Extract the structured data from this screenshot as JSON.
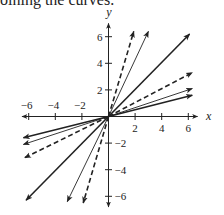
{
  "caption": "oining the curves.",
  "chart_data": {
    "type": "line",
    "title": "",
    "xlabel": "x",
    "ylabel": "y",
    "xlim": [
      -6.5,
      6.7
    ],
    "ylim": [
      -6.8,
      7.0
    ],
    "xticks": [
      -6,
      -4,
      -2,
      2,
      4,
      6
    ],
    "yticks": [
      6,
      4,
      2,
      -2,
      -4,
      -6
    ],
    "xtick_labels": [
      "-6",
      "-4",
      "-2",
      "2",
      "4",
      "6"
    ],
    "ytick_labels": [
      "6",
      "4",
      "2",
      "-2",
      "-4",
      "-6"
    ],
    "grid": false,
    "legend": null,
    "series": [
      {
        "name": "steep-dashed-up",
        "style": "dashed",
        "weight": "bold",
        "from": [
          0,
          0
        ],
        "to": [
          1.9,
          6.4
        ]
      },
      {
        "name": "steep-thin-up",
        "style": "solid",
        "weight": "thin",
        "from": [
          0,
          0
        ],
        "to": [
          3.0,
          6.4
        ]
      },
      {
        "name": "diag-bold-up",
        "style": "solid",
        "weight": "bold",
        "from": [
          0,
          0
        ],
        "to": [
          6.1,
          6.2
        ]
      },
      {
        "name": "shallow-dashed-up",
        "style": "dashed",
        "weight": "bold",
        "from": [
          0,
          0
        ],
        "to": [
          6.3,
          3.3
        ]
      },
      {
        "name": "shallow-thin-up",
        "style": "solid",
        "weight": "thin",
        "from": [
          0,
          0
        ],
        "to": [
          6.3,
          2.1
        ]
      },
      {
        "name": "shallow-bold-up",
        "style": "solid",
        "weight": "bold",
        "from": [
          0,
          0
        ],
        "to": [
          6.3,
          1.6
        ]
      },
      {
        "name": "shallow-bold-down",
        "style": "solid",
        "weight": "bold",
        "from": [
          0,
          0
        ],
        "to": [
          -6.4,
          -1.6
        ]
      },
      {
        "name": "shallow-thin-down",
        "style": "solid",
        "weight": "thin",
        "from": [
          0,
          0
        ],
        "to": [
          -6.4,
          -2.1
        ]
      },
      {
        "name": "shallow-dashed-down",
        "style": "dashed",
        "weight": "bold",
        "from": [
          0,
          0
        ],
        "to": [
          -6.3,
          -3.1
        ]
      },
      {
        "name": "diag-bold-down",
        "style": "solid",
        "weight": "bold",
        "from": [
          0,
          0
        ],
        "to": [
          -6.2,
          -6.3
        ]
      },
      {
        "name": "steep-thin-down",
        "style": "solid",
        "weight": "thin",
        "from": [
          0,
          0
        ],
        "to": [
          -3.1,
          -6.4
        ]
      },
      {
        "name": "steep-dashed-down",
        "style": "dashed",
        "weight": "bold",
        "from": [
          0,
          0
        ],
        "to": [
          -1.9,
          -6.5
        ]
      }
    ]
  },
  "colors": {
    "ink": "#222222",
    "background": "#ffffff"
  }
}
